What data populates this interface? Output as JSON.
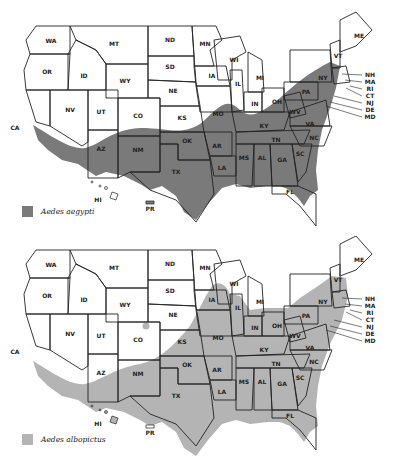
{
  "maps": [
    {
      "id": "top",
      "species": "Aedes aegypti",
      "fill_color": "#7a7a7a",
      "legend_label": "Aedes aegypti"
    },
    {
      "id": "bottom",
      "species": "Aedes albopictus",
      "fill_color": "#b4b4b4",
      "legend_label": "Aedes albopictus"
    }
  ],
  "state_labels": {
    "WA": "WA",
    "OR": "OR",
    "CA": "CA",
    "ID": "ID",
    "NV": "NV",
    "MT": "MT",
    "WY": "WY",
    "UT": "UT",
    "AZ": "AZ",
    "CO": "CO",
    "NM": "NM",
    "ND": "ND",
    "SD": "SD",
    "NE": "NE",
    "KS": "KS",
    "OK": "OK",
    "TX": "TX",
    "MN": "MN",
    "IA": "IA",
    "MO": "MO",
    "AR": "AR",
    "LA": "LA",
    "WI": "WI",
    "IL": "IL",
    "MI": "MI",
    "IN": "IN",
    "OH": "OH",
    "KY": "KY",
    "TN": "TN",
    "MS": "MS",
    "AL": "AL",
    "GA": "GA",
    "FL": "FL",
    "SC": "SC",
    "NC": "NC",
    "VA": "VA",
    "WV": "WV",
    "PA": "PA",
    "NY": "NY",
    "VT": "VT",
    "ME": "ME",
    "HI": "HI",
    "PR": "PR"
  },
  "callouts": [
    "NH",
    "MA",
    "RI",
    "CT",
    "NJ",
    "DE",
    "MD"
  ]
}
